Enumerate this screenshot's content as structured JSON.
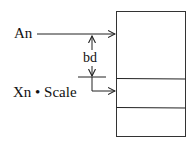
{
  "diagram": {
    "labels": {
      "base": "An",
      "displacement": "bd",
      "index": "Xn • Scale"
    },
    "memory_block": {
      "cells": 3
    },
    "colors": {
      "line": "#222222",
      "text": "#111111",
      "background": "#ffffff"
    }
  }
}
